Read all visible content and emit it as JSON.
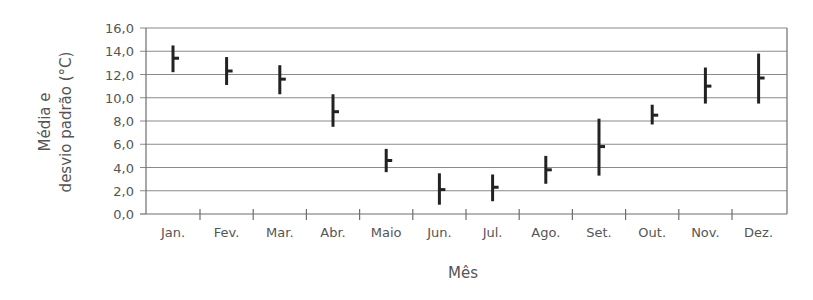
{
  "chart_data": {
    "type": "error-bar",
    "title": "",
    "xlabel": "Mês",
    "ylabel_lines": [
      "Média e",
      "desvio padrão (°C)"
    ],
    "ylabel": "Média e desvio padrão (°C)",
    "ylim": [
      0,
      16
    ],
    "yticks": [
      0,
      2,
      4,
      6,
      8,
      10,
      12,
      14,
      16
    ],
    "ytick_labels": [
      "0,0",
      "2,0",
      "4,0",
      "6,0",
      "8,0",
      "10,0",
      "12,0",
      "14,0",
      "16,0"
    ],
    "grid": true,
    "legend": null,
    "categories": [
      "Jan.",
      "Fev.",
      "Mar.",
      "Abr.",
      "Maio",
      "Jun.",
      "Jul.",
      "Ago.",
      "Set.",
      "Out.",
      "Nov.",
      "Dez."
    ],
    "series": [
      {
        "name": "Temperatura",
        "mean": [
          13.4,
          12.3,
          11.6,
          8.8,
          4.6,
          2.1,
          2.3,
          3.8,
          5.8,
          8.5,
          11.0,
          11.7
        ],
        "low": [
          12.2,
          11.1,
          10.3,
          7.5,
          3.6,
          0.8,
          1.1,
          2.6,
          3.3,
          7.7,
          9.5,
          9.5
        ],
        "high": [
          14.5,
          13.5,
          12.8,
          10.3,
          5.6,
          3.5,
          3.4,
          5.0,
          8.2,
          9.4,
          12.6,
          13.8
        ]
      }
    ],
    "colors": {
      "bars": "#222222",
      "grid": "#8a8a8a",
      "axis": "#6e6e6e",
      "text": "#555555"
    }
  }
}
